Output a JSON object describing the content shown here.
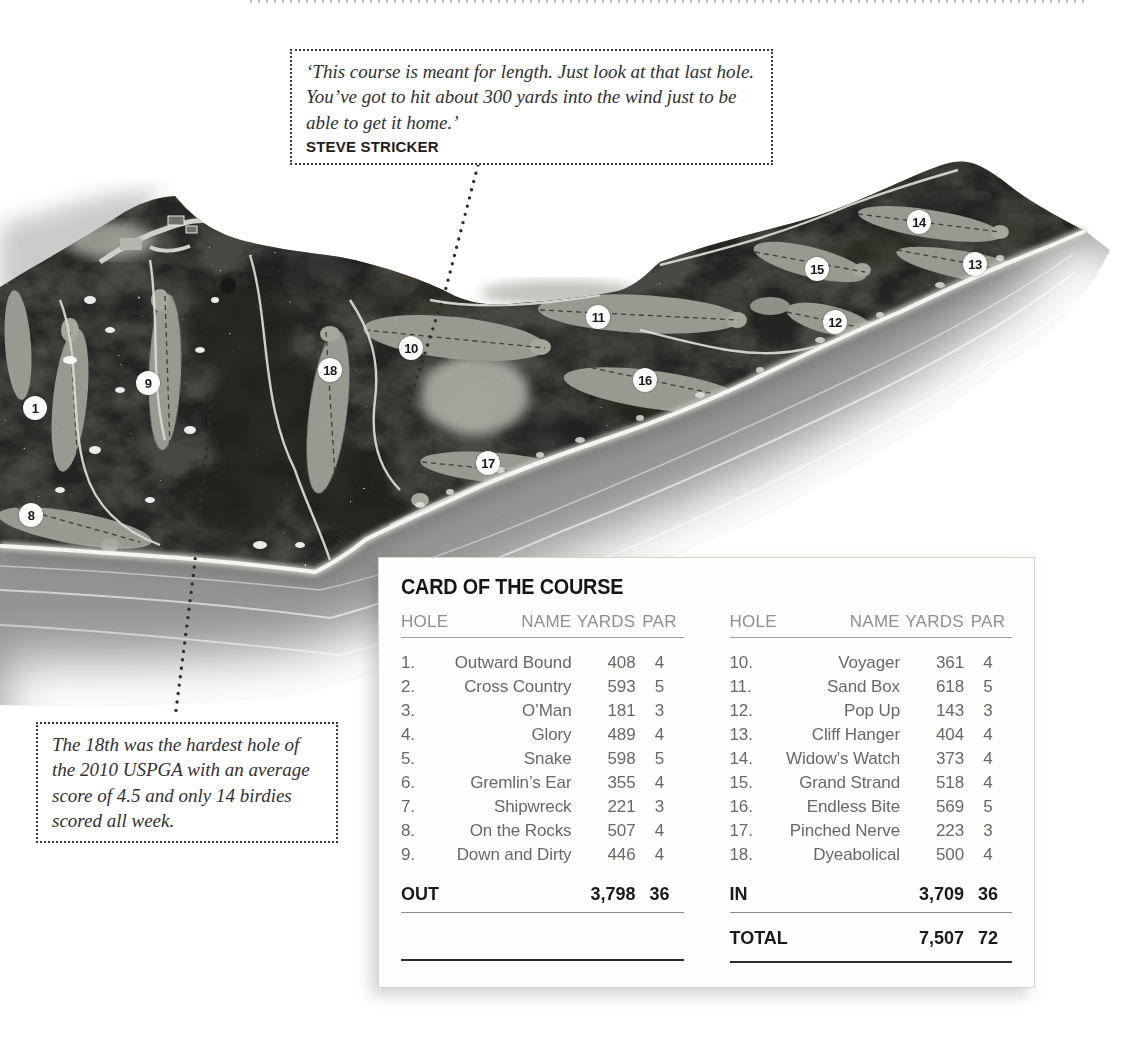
{
  "quote_box": {
    "text": "‘This course is meant for length. Just look at that last hole. You’ve got to hit about 300 yards into the wind just to be able to get it home.’",
    "attribution": "STEVE STRICKER"
  },
  "note_box": {
    "text": "The 18th was the hardest hole of the 2010 USPGA with an average score of 4.5 and only 14 birdies scored all week."
  },
  "map": {
    "hole_markers": [
      {
        "number": "1",
        "x": 35,
        "y": 408
      },
      {
        "number": "8",
        "x": 31,
        "y": 515
      },
      {
        "number": "9",
        "x": 148,
        "y": 383
      },
      {
        "number": "18",
        "x": 330,
        "y": 370
      },
      {
        "number": "10",
        "x": 411,
        "y": 348
      },
      {
        "number": "17",
        "x": 488,
        "y": 463
      },
      {
        "number": "11",
        "x": 598,
        "y": 317
      },
      {
        "number": "16",
        "x": 645,
        "y": 380
      },
      {
        "number": "15",
        "x": 817,
        "y": 269
      },
      {
        "number": "12",
        "x": 835,
        "y": 322
      },
      {
        "number": "14",
        "x": 919,
        "y": 222
      },
      {
        "number": "13",
        "x": 975,
        "y": 264
      }
    ]
  },
  "scorecard": {
    "title": "CARD OF THE COURSE",
    "columns": [
      "HOLE",
      "NAME",
      "YARDS",
      "PAR"
    ],
    "front_nine": [
      {
        "hole": "1.",
        "name": "Outward Bound",
        "yards": "408",
        "par": "4"
      },
      {
        "hole": "2.",
        "name": "Cross Country",
        "yards": "593",
        "par": "5"
      },
      {
        "hole": "3.",
        "name": "O’Man",
        "yards": "181",
        "par": "3"
      },
      {
        "hole": "4.",
        "name": "Glory",
        "yards": "489",
        "par": "4"
      },
      {
        "hole": "5.",
        "name": "Snake",
        "yards": "598",
        "par": "5"
      },
      {
        "hole": "6.",
        "name": "Gremlin’s Ear",
        "yards": "355",
        "par": "4"
      },
      {
        "hole": "7.",
        "name": "Shipwreck",
        "yards": "221",
        "par": "3"
      },
      {
        "hole": "8.",
        "name": "On the Rocks",
        "yards": "507",
        "par": "4"
      },
      {
        "hole": "9.",
        "name": "Down and Dirty",
        "yards": "446",
        "par": "4"
      }
    ],
    "back_nine": [
      {
        "hole": "10.",
        "name": "Voyager",
        "yards": "361",
        "par": "4"
      },
      {
        "hole": "11.",
        "name": "Sand Box",
        "yards": "618",
        "par": "5"
      },
      {
        "hole": "12.",
        "name": "Pop Up",
        "yards": "143",
        "par": "3"
      },
      {
        "hole": "13.",
        "name": "Cliff Hanger",
        "yards": "404",
        "par": "4"
      },
      {
        "hole": "14.",
        "name": "Widow’s Watch",
        "yards": "373",
        "par": "4"
      },
      {
        "hole": "15.",
        "name": "Grand Strand",
        "yards": "518",
        "par": "4"
      },
      {
        "hole": "16.",
        "name": "Endless Bite",
        "yards": "569",
        "par": "5"
      },
      {
        "hole": "17.",
        "name": "Pinched Nerve",
        "yards": "223",
        "par": "3"
      },
      {
        "hole": "18.",
        "name": "Dyeabolical",
        "yards": "500",
        "par": "4"
      }
    ],
    "out": {
      "label": "OUT",
      "yards": "3,798",
      "par": "36"
    },
    "in": {
      "label": "IN",
      "yards": "3,709",
      "par": "36"
    },
    "total": {
      "label": "TOTAL",
      "yards": "7,507",
      "par": "72"
    }
  },
  "colors": {
    "ink": "#1c1c1c",
    "table_text": "#67686a",
    "table_header": "#8d8f91",
    "land": "#4a4844",
    "fairway": "#99998f",
    "water": "#939393",
    "marker_bg": "#fcfcfb"
  }
}
